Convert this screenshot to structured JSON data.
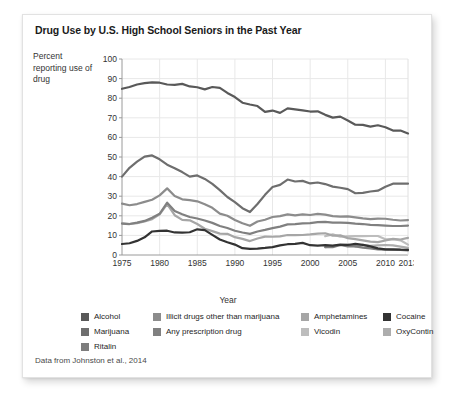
{
  "chart_title": "Drug Use by U.S. High School Seniors in the Past Year",
  "axis_label_y": "Percent reporting use of drug",
  "axis_label_x": "Year",
  "source_note": "Data from Johnston et al., 2014",
  "legend": {
    "columns": [
      [
        {
          "label": "Alcohol",
          "color": "#595959"
        },
        {
          "label": "Marijuana",
          "color": "#6e6e6e"
        },
        {
          "label": "Ritalin",
          "color": "#7d7d7d"
        }
      ],
      [
        {
          "label": "Illicit drugs other than marijuana",
          "color": "#8c8c8c"
        },
        {
          "label": "Any prescription drug",
          "color": "#808080"
        }
      ],
      [
        {
          "label": "Amphetamines",
          "color": "#a6a6a6"
        },
        {
          "label": "Vicodin",
          "color": "#bdbdbd"
        }
      ],
      [
        {
          "label": "Cocaine",
          "color": "#333333"
        },
        {
          "label": "OxyContin",
          "color": "#adadad"
        }
      ]
    ]
  },
  "chart_data": {
    "type": "line",
    "title": "Drug Use by U.S. High School Seniors in the Past Year",
    "xlabel": "Year",
    "ylabel": "Percent reporting use of drug",
    "xlim": [
      1975,
      2013
    ],
    "ylim": [
      0,
      100
    ],
    "ytick_step": 10,
    "yticks": [
      0,
      10,
      20,
      30,
      40,
      50,
      60,
      70,
      80,
      90,
      100
    ],
    "xticks": [
      1975,
      1980,
      1985,
      1990,
      1995,
      2000,
      2005,
      2010,
      2013
    ],
    "xtick_labels": [
      "1975",
      "1980",
      "1985",
      "1990",
      "1995",
      "2000",
      "2005",
      "2010",
      "2013"
    ],
    "grid": true,
    "legend_position": "bottom",
    "series": [
      {
        "name": "Alcohol",
        "color": "#595959",
        "x": [
          1975,
          1976,
          1977,
          1978,
          1979,
          1980,
          1981,
          1982,
          1983,
          1984,
          1985,
          1986,
          1987,
          1988,
          1989,
          1990,
          1991,
          1992,
          1993,
          1994,
          1995,
          1996,
          1997,
          1998,
          1999,
          2000,
          2001,
          2002,
          2003,
          2004,
          2005,
          2006,
          2007,
          2008,
          2009,
          2010,
          2011,
          2012,
          2013
        ],
        "values": [
          84.8,
          85.7,
          87.0,
          87.7,
          88.1,
          87.9,
          87.0,
          86.8,
          87.3,
          86.0,
          85.6,
          84.5,
          85.7,
          85.3,
          82.7,
          80.6,
          77.7,
          76.8,
          76.0,
          73.0,
          73.7,
          72.5,
          74.8,
          74.3,
          73.8,
          73.2,
          73.3,
          71.5,
          70.1,
          70.6,
          68.6,
          66.5,
          66.4,
          65.5,
          66.2,
          65.2,
          63.5,
          63.5,
          62.0
        ]
      },
      {
        "name": "Marijuana",
        "color": "#6e6e6e",
        "x": [
          1975,
          1976,
          1977,
          1978,
          1979,
          1980,
          1981,
          1982,
          1983,
          1984,
          1985,
          1986,
          1987,
          1988,
          1989,
          1990,
          1991,
          1992,
          1993,
          1994,
          1995,
          1996,
          1997,
          1998,
          1999,
          2000,
          2001,
          2002,
          2003,
          2004,
          2005,
          2006,
          2007,
          2008,
          2009,
          2010,
          2011,
          2012,
          2013
        ],
        "values": [
          40.0,
          44.5,
          47.6,
          50.2,
          50.8,
          48.8,
          46.1,
          44.3,
          42.3,
          40.0,
          40.6,
          38.8,
          36.3,
          33.1,
          29.6,
          27.0,
          23.9,
          21.9,
          26.0,
          30.7,
          34.7,
          35.8,
          38.5,
          37.5,
          37.8,
          36.5,
          37.0,
          36.2,
          34.9,
          34.3,
          33.6,
          31.5,
          31.7,
          32.4,
          32.8,
          34.8,
          36.4,
          36.4,
          36.4
        ]
      },
      {
        "name": "Illicit drugs other than marijuana",
        "color": "#8c8c8c",
        "x": [
          1975,
          1976,
          1977,
          1978,
          1979,
          1980,
          1981,
          1982,
          1983,
          1984,
          1985,
          1986,
          1987,
          1988,
          1989,
          1990,
          1991,
          1992,
          1993,
          1994,
          1995,
          1996,
          1997,
          1998,
          1999,
          2000,
          2001,
          2002,
          2003,
          2004,
          2005,
          2006,
          2007,
          2008,
          2009,
          2010,
          2011,
          2012,
          2013
        ],
        "values": [
          26.2,
          25.4,
          26.0,
          27.1,
          28.2,
          30.4,
          34.0,
          30.1,
          28.4,
          28.0,
          27.4,
          25.9,
          24.1,
          21.1,
          20.0,
          17.9,
          16.2,
          14.9,
          17.1,
          18.0,
          19.4,
          19.8,
          20.7,
          20.2,
          20.7,
          20.4,
          21.0,
          20.6,
          19.8,
          19.6,
          19.7,
          19.2,
          18.7,
          18.3,
          18.6,
          18.5,
          18.0,
          17.6,
          17.8
        ]
      },
      {
        "name": "Any prescription drug",
        "color": "#808080",
        "x": [
          1975,
          1976,
          1977,
          1978,
          1979,
          1980,
          1981,
          1982,
          1983,
          1984,
          1985,
          1986,
          1987,
          1988,
          1989,
          1990,
          1991,
          1992,
          1993,
          1994,
          1995,
          1996,
          1997,
          1998,
          1999,
          2000,
          2001,
          2002,
          2003,
          2004,
          2005,
          2006,
          2007,
          2008,
          2009,
          2010,
          2011,
          2012,
          2013
        ],
        "values": [
          16.0,
          15.8,
          16.5,
          17.4,
          19.0,
          21.0,
          26.7,
          22.4,
          20.8,
          19.4,
          18.6,
          17.6,
          16.4,
          14.8,
          13.8,
          12.4,
          11.5,
          10.8,
          12.0,
          12.8,
          13.7,
          14.5,
          15.6,
          15.8,
          16.1,
          16.3,
          16.8,
          16.9,
          16.5,
          16.5,
          16.4,
          16.0,
          15.8,
          15.4,
          15.2,
          15.0,
          14.8,
          14.8,
          15.0
        ]
      },
      {
        "name": "Amphetamines",
        "color": "#a6a6a6",
        "x": [
          1975,
          1976,
          1977,
          1978,
          1979,
          1980,
          1981,
          1982,
          1983,
          1984,
          1985,
          1986,
          1987,
          1988,
          1989,
          1990,
          1991,
          1992,
          1993,
          1994,
          1995,
          1996,
          1997,
          1998,
          1999,
          2000,
          2001,
          2002,
          2003,
          2004,
          2005,
          2006,
          2007,
          2008,
          2009,
          2010,
          2011,
          2012,
          2013
        ],
        "values": [
          16.2,
          15.8,
          16.3,
          17.1,
          18.3,
          20.8,
          26.0,
          20.3,
          17.9,
          17.7,
          15.8,
          13.4,
          12.2,
          10.9,
          10.8,
          9.1,
          8.2,
          7.1,
          8.4,
          9.4,
          9.3,
          9.5,
          10.2,
          10.1,
          10.2,
          10.5,
          10.9,
          11.1,
          9.9,
          10.0,
          8.6,
          8.1,
          7.5,
          6.8,
          6.6,
          7.4,
          8.2,
          7.9,
          8.7
        ]
      },
      {
        "name": "Cocaine",
        "color": "#333333",
        "x": [
          1975,
          1976,
          1977,
          1978,
          1979,
          1980,
          1981,
          1982,
          1983,
          1984,
          1985,
          1986,
          1987,
          1988,
          1989,
          1990,
          1991,
          1992,
          1993,
          1994,
          1995,
          1996,
          1997,
          1998,
          1999,
          2000,
          2001,
          2002,
          2003,
          2004,
          2005,
          2006,
          2007,
          2008,
          2009,
          2010,
          2011,
          2012,
          2013
        ],
        "values": [
          5.6,
          6.0,
          7.2,
          9.0,
          12.0,
          12.3,
          12.4,
          11.5,
          11.4,
          11.6,
          13.1,
          12.7,
          10.3,
          7.9,
          6.5,
          5.3,
          3.5,
          3.1,
          3.3,
          3.6,
          4.0,
          4.9,
          5.5,
          5.7,
          6.2,
          5.0,
          4.8,
          5.0,
          4.8,
          5.3,
          5.1,
          5.7,
          5.2,
          4.4,
          3.4,
          2.9,
          2.9,
          2.7,
          2.6
        ]
      },
      {
        "name": "Vicodin",
        "color": "#bdbdbd",
        "x": [
          2002,
          2003,
          2004,
          2005,
          2006,
          2007,
          2008,
          2009,
          2010,
          2011,
          2012,
          2013
        ],
        "values": [
          9.6,
          10.5,
          9.3,
          9.5,
          9.7,
          9.6,
          9.7,
          9.7,
          8.0,
          8.1,
          7.5,
          5.3
        ]
      },
      {
        "name": "OxyContin",
        "color": "#adadad",
        "x": [
          2002,
          2003,
          2004,
          2005,
          2006,
          2007,
          2008,
          2009,
          2010,
          2011,
          2012,
          2013
        ],
        "values": [
          4.0,
          4.5,
          5.0,
          5.5,
          4.3,
          5.2,
          4.7,
          4.9,
          5.1,
          4.9,
          4.3,
          3.6
        ]
      },
      {
        "name": "Ritalin",
        "color": "#7d7d7d",
        "x": [
          2002,
          2003,
          2004,
          2005,
          2006,
          2007,
          2008,
          2009,
          2010,
          2011,
          2012,
          2013
        ],
        "values": [
          4.0,
          4.0,
          5.1,
          4.4,
          4.4,
          3.8,
          3.4,
          2.8,
          2.7,
          2.6,
          2.6,
          2.3
        ]
      }
    ]
  }
}
